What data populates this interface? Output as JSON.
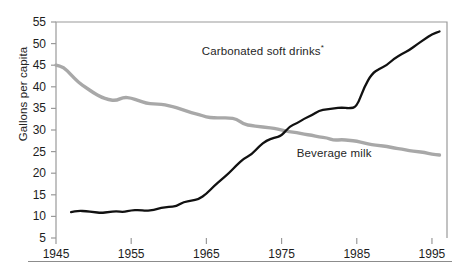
{
  "figure": {
    "ylabel": "Gallons per capita",
    "yticks": [
      5,
      10,
      15,
      20,
      25,
      30,
      35,
      40,
      45,
      50,
      55
    ],
    "xticks": [
      1945,
      1955,
      1965,
      1975,
      1985,
      1995
    ],
    "labels": {
      "soft_drinks": "Carbonated soft drinks",
      "soft_drinks_footnote": "*",
      "milk": "Beverage milk"
    },
    "colors": {
      "soft_drinks": "#111111",
      "milk": "#a8a8a8",
      "axis": "#9a9a9a",
      "text": "#1d1d1d"
    }
  },
  "chart_data": {
    "type": "line",
    "title": "",
    "xlabel": "",
    "ylabel": "Gallons per capita",
    "xlim": [
      1945,
      1997
    ],
    "ylim": [
      5,
      55
    ],
    "grid": false,
    "legend": "inline-annotations",
    "xticks": [
      1945,
      1955,
      1965,
      1975,
      1985,
      1995
    ],
    "yticks": [
      5,
      10,
      15,
      20,
      25,
      30,
      35,
      40,
      45,
      50,
      55
    ],
    "series": [
      {
        "name": "Carbonated soft drinks",
        "footnote": "*",
        "color": "#111111",
        "x": [
          1947,
          1948,
          1949,
          1950,
          1951,
          1952,
          1953,
          1954,
          1955,
          1956,
          1957,
          1958,
          1959,
          1960,
          1961,
          1962,
          1963,
          1964,
          1965,
          1966,
          1967,
          1968,
          1969,
          1970,
          1971,
          1972,
          1973,
          1974,
          1975,
          1976,
          1977,
          1978,
          1979,
          1980,
          1981,
          1982,
          1983,
          1984,
          1985,
          1986,
          1987,
          1988,
          1989,
          1990,
          1991,
          1992,
          1993,
          1994,
          1995,
          1996
        ],
        "values": [
          11.0,
          11.3,
          11.2,
          11.0,
          10.8,
          11.0,
          11.2,
          11.0,
          11.4,
          11.5,
          11.3,
          11.5,
          12.0,
          12.2,
          12.3,
          13.4,
          13.6,
          14.0,
          15.2,
          17.0,
          18.5,
          20.0,
          21.8,
          23.4,
          24.3,
          26.2,
          27.6,
          28.2,
          28.6,
          30.8,
          31.5,
          32.6,
          33.4,
          34.5,
          34.8,
          35.0,
          35.2,
          35.0,
          35.3,
          40.0,
          43.0,
          44.2,
          45.0,
          46.6,
          47.6,
          48.5,
          49.8,
          51.0,
          52.2,
          52.8
        ]
      },
      {
        "name": "Beverage milk",
        "color": "#a8a8a8",
        "x": [
          1945,
          1946,
          1947,
          1948,
          1949,
          1950,
          1951,
          1952,
          1953,
          1954,
          1955,
          1956,
          1957,
          1958,
          1959,
          1960,
          1961,
          1962,
          1963,
          1964,
          1965,
          1966,
          1967,
          1968,
          1969,
          1970,
          1971,
          1972,
          1973,
          1974,
          1975,
          1976,
          1977,
          1978,
          1979,
          1980,
          1981,
          1982,
          1983,
          1984,
          1985,
          1986,
          1987,
          1988,
          1989,
          1990,
          1991,
          1992,
          1993,
          1994,
          1995,
          1996
        ],
        "values": [
          45.0,
          44.6,
          42.8,
          41.0,
          39.8,
          38.6,
          37.6,
          37.0,
          36.8,
          37.6,
          37.4,
          36.8,
          36.2,
          36.0,
          36.0,
          35.6,
          35.2,
          34.6,
          34.0,
          33.6,
          33.0,
          32.8,
          32.8,
          32.8,
          32.6,
          31.3,
          31.0,
          30.8,
          30.6,
          30.4,
          30.0,
          29.6,
          29.4,
          29.0,
          28.8,
          28.4,
          28.2,
          27.6,
          27.8,
          27.6,
          27.4,
          27.0,
          26.6,
          26.4,
          26.2,
          25.8,
          25.6,
          25.2,
          25.0,
          24.8,
          24.4,
          24.2
        ]
      }
    ],
    "annotations": [
      {
        "text": "Carbonated soft drinks*",
        "x": 1981,
        "y": 48
      },
      {
        "text": "Beverage milk",
        "x": 1983,
        "y": 28
      }
    ]
  }
}
